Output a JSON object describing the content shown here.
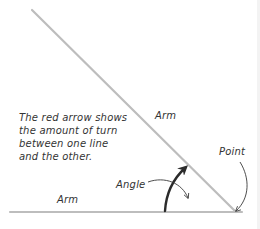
{
  "diagram": {
    "description_lines": [
      "The red arrow shows",
      "the amount of turn",
      "between one line",
      "and the other."
    ],
    "labels": {
      "arm_diagonal": "Arm",
      "arm_horizontal": "Arm",
      "angle": "Angle",
      "point": "Point"
    },
    "colors": {
      "arm_line": "#bdbdbd",
      "angle_arrow": "#2b2b2b",
      "leader_line": "#3a3a3a",
      "text": "#333333",
      "background": "#ffffff"
    },
    "geometry": {
      "vertex": [
        236,
        212
      ],
      "diagonal_arm_start": [
        32,
        10
      ],
      "horizontal_arm_start": [
        10,
        212
      ]
    }
  }
}
